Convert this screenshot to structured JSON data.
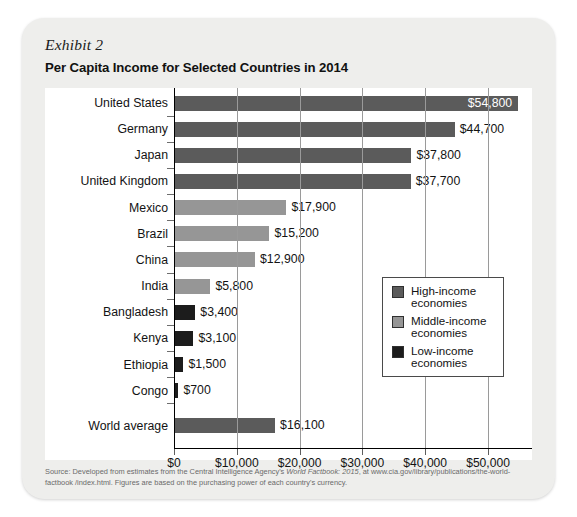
{
  "exhibit": {
    "label": "Exhibit 2",
    "title": "Per Capita Income for Selected Countries in 2014"
  },
  "source": {
    "part1": "Source: Developed from estimates from the Central Intelligence Agency's ",
    "italic": "World Factbook: 2015",
    "part2": ", at www.cia.gov/library/publications/the-world-factbook /index.html. Figures are based on the purchasing power of each country's currency."
  },
  "legend": {
    "items": [
      {
        "label": "High-income\neconomies",
        "group": "high",
        "color": "#5b5b5b"
      },
      {
        "label": "Middle-income\neconomies",
        "group": "middle",
        "color": "#969696"
      },
      {
        "label": "Low-income\neconomies",
        "group": "low",
        "color": "#1c1c1c"
      }
    ]
  },
  "chart_data": {
    "type": "bar",
    "orientation": "horizontal",
    "title": "Per Capita Income for Selected Countries in 2014",
    "xlabel": "",
    "ylabel": "",
    "xlim": [
      0,
      57000
    ],
    "grid": true,
    "legend_position": "inside-right",
    "xticks": [
      0,
      10000,
      20000,
      30000,
      40000,
      50000
    ],
    "xtick_labels": [
      "$0",
      "$10,000",
      "$20,000",
      "$30,000",
      "$40,000",
      "$50,000"
    ],
    "categories": [
      "United States",
      "Germany",
      "Japan",
      "United Kingdom",
      "Mexico",
      "Brazil",
      "China",
      "India",
      "Bangladesh",
      "Kenya",
      "Ethiopia",
      "Congo",
      "World average"
    ],
    "values": [
      54800,
      44700,
      37800,
      37700,
      17900,
      15200,
      12900,
      5800,
      3400,
      3100,
      1500,
      700,
      16100
    ],
    "value_labels": [
      "$54,800",
      "$44,700",
      "$37,800",
      "$37,700",
      "$17,900",
      "$15,200",
      "$12,900",
      "$5,800",
      "$3,400",
      "$3,100",
      "$1,500",
      "$700",
      "$16,100"
    ],
    "groups": [
      "high",
      "high",
      "high",
      "high",
      "middle",
      "middle",
      "middle",
      "middle",
      "low",
      "low",
      "low",
      "low",
      "high"
    ],
    "colors": {
      "high": "#5b5b5b",
      "middle": "#969696",
      "low": "#1c1c1c"
    }
  }
}
